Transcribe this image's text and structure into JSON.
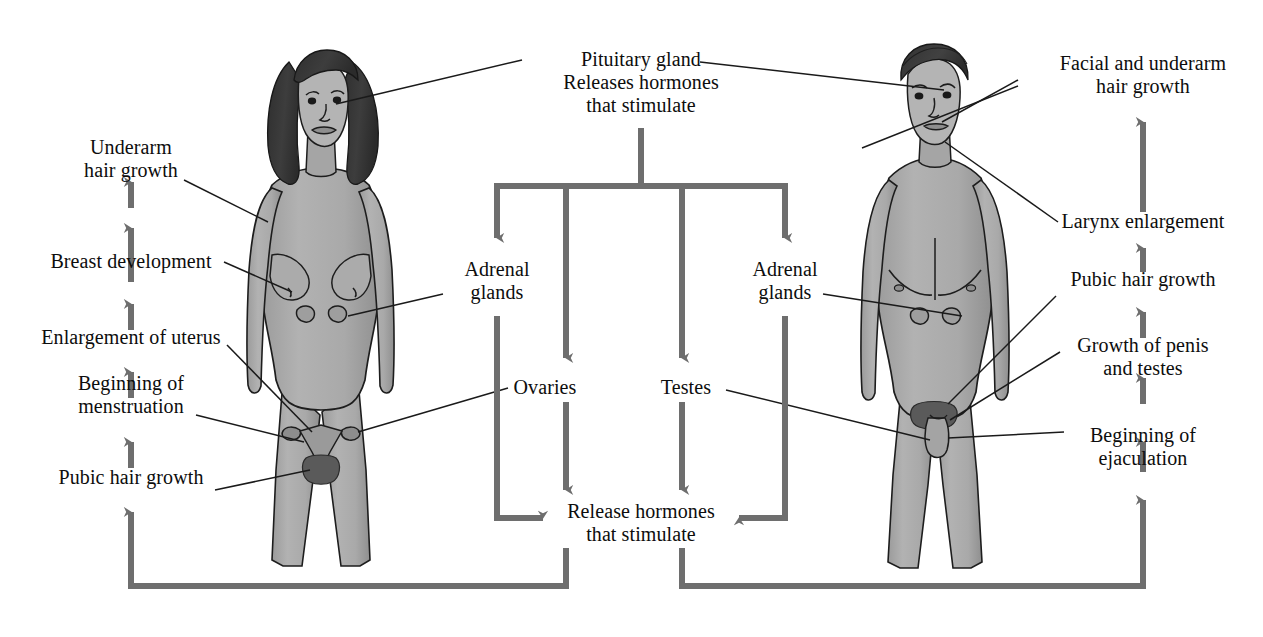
{
  "diagram": {
    "colors": {
      "arrow": "#6e6e6e",
      "leader": "#1a1a1a",
      "skin": "#a8a8a8",
      "skin_shadow": "#8e8e8e",
      "hair_dark": "#3a3a3a",
      "background": "#ffffff",
      "text": "#0d0d0d"
    },
    "center": {
      "pituitary": "Pituitary gland\nReleases hormones\nthat stimulate",
      "adrenal_left": "Adrenal\nglands",
      "adrenal_right": "Adrenal\nglands",
      "ovaries": "Ovaries",
      "testes": "Testes",
      "release": "Release hormones\nthat stimulate"
    },
    "female_labels": [
      {
        "text": "Underarm\nhair growth"
      },
      {
        "text": "Breast development"
      },
      {
        "text": "Enlargement of uterus"
      },
      {
        "text": "Beginning of\nmenstruation"
      },
      {
        "text": "Pubic hair growth"
      }
    ],
    "male_labels": [
      {
        "text": "Facial and underarm\nhair growth"
      },
      {
        "text": "Larynx enlargement"
      },
      {
        "text": "Pubic hair growth"
      },
      {
        "text": "Growth of penis\nand testes"
      },
      {
        "text": "Beginning of\nejaculation"
      }
    ],
    "figures": {
      "female": "female-body-illustration",
      "male": "male-body-illustration"
    }
  }
}
